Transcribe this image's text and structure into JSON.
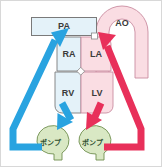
{
  "diagram": {
    "colors": {
      "venous_blue": "#29a3e0",
      "arterial_red": "#e8305a",
      "chamber_blue_fill": "#e4f2f9",
      "chamber_pink_fill": "#fadde3",
      "pump_green_fill": "#d9e8c4",
      "pump_green_stroke": "#6f8f4f",
      "outline_gray": "#7a7a7a",
      "outline_pink": "#d98ba0",
      "label_text": "#3a3a3a",
      "frame_border": "#d8d8d8",
      "page_background": "#ffffff"
    },
    "vessels": [
      {
        "id": "pa",
        "label": "PA",
        "shape": "rectangle",
        "fill": "chamber_blue_fill"
      },
      {
        "id": "ao",
        "label": "AO",
        "shape": "arch",
        "fill": "chamber_pink_fill"
      }
    ],
    "chambers": [
      {
        "id": "ra",
        "label": "RA",
        "side": "right-atrium",
        "fill": "chamber_blue_fill"
      },
      {
        "id": "la",
        "label": "LA",
        "side": "left-atrium",
        "fill": "chamber_pink_fill"
      },
      {
        "id": "rv",
        "label": "RV",
        "side": "right-ventricle",
        "fill": "chamber_blue_fill"
      },
      {
        "id": "lv",
        "label": "LV",
        "side": "left-ventricle",
        "fill": "chamber_pink_fill"
      }
    ],
    "pumps": [
      {
        "id": "pump-left",
        "label": "ポンプ",
        "fill": "pump_green_fill"
      },
      {
        "id": "pump-right",
        "label": "ポンプ",
        "fill": "pump_green_fill"
      }
    ],
    "flows": [
      {
        "id": "flow-venous",
        "color": "venous_blue",
        "from": "RV",
        "to": "pump-left"
      },
      {
        "id": "flow-venous-return",
        "color": "venous_blue",
        "from": "pump-left",
        "to": "PA"
      },
      {
        "id": "flow-arterial",
        "color": "arterial_red",
        "from": "LV",
        "to": "pump-right"
      },
      {
        "id": "flow-arterial-return",
        "color": "arterial_red",
        "from": "pump-right",
        "to": "AO"
      }
    ],
    "valves": [
      {
        "id": "valve-center",
        "shape": "diamond"
      },
      {
        "id": "valve-aortic",
        "shape": "square"
      }
    ]
  }
}
